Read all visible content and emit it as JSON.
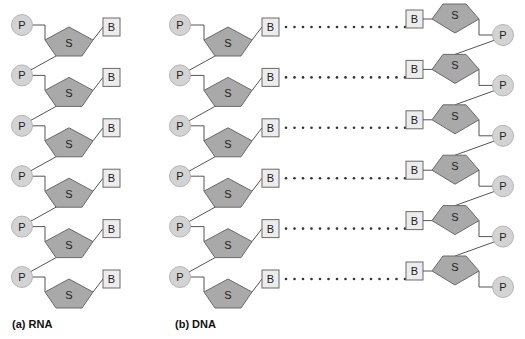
{
  "labels": {
    "phosphate": "P",
    "sugar": "S",
    "base": "B"
  },
  "captions": {
    "rna": "(a) RNA",
    "dna": "(b) DNA"
  },
  "colors": {
    "phosphate_fill": "#d3d3d3",
    "sugar_fill": "#a9a9a9",
    "base_fill": "#ececec",
    "stroke": "#6a6a6a"
  },
  "rna": {
    "nucleotide_count": 6
  },
  "dna": {
    "base_pair_count": 6,
    "hydrogen_bond_dots_per_pair": 15
  }
}
